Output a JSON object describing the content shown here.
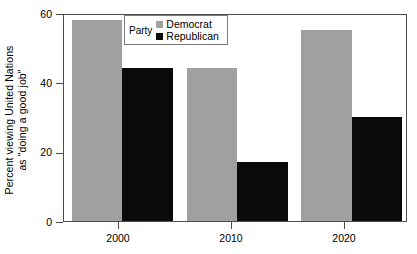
{
  "chart_data": {
    "type": "bar",
    "title": "",
    "subtitle": "",
    "xlabel": "",
    "ylabel": "Percent viewing United Nations as \"doing a good job\"",
    "ylabel_line1": "Percent viewing United Nations",
    "ylabel_line2": "as \"doing a good job\"",
    "categories": [
      "2000",
      "2010",
      "2020"
    ],
    "series": [
      {
        "name": "Democrat",
        "color": "#a0a0a0",
        "values": [
          58,
          44,
          55
        ]
      },
      {
        "name": "Republican",
        "color": "#0a0a0a",
        "values": [
          44,
          17,
          30
        ]
      }
    ],
    "ylim": [
      0,
      60
    ],
    "yticks": [
      0,
      20,
      40,
      60
    ],
    "ytick_labels": [
      "0",
      "20",
      "40",
      "60"
    ],
    "xtick_labels": [
      "2000",
      "2010",
      "2020"
    ],
    "grid": false,
    "legend_position": "top-left-inside",
    "legend_title": "Party",
    "legend_entries": [
      "Democrat",
      "Republican"
    ]
  },
  "axis": {
    "y_title_line1": "Percent viewing United Nations",
    "y_title_line2": "as \"doing a good job\"",
    "y_labels": [
      "60",
      "40",
      "20",
      "0"
    ],
    "x_labels": [
      "2000",
      "2010",
      "2020"
    ]
  },
  "legend": {
    "title": "Party",
    "rows": [
      {
        "label": "Democrat",
        "color": "#a0a0a0"
      },
      {
        "label": "Republican",
        "color": "#0a0a0a"
      }
    ]
  },
  "colors": {
    "democrat": "#a0a0a0",
    "republican": "#0a0a0a",
    "axis": "#4d4d4d",
    "legend_border": "#7a7a7a",
    "background": "#ffffff"
  }
}
